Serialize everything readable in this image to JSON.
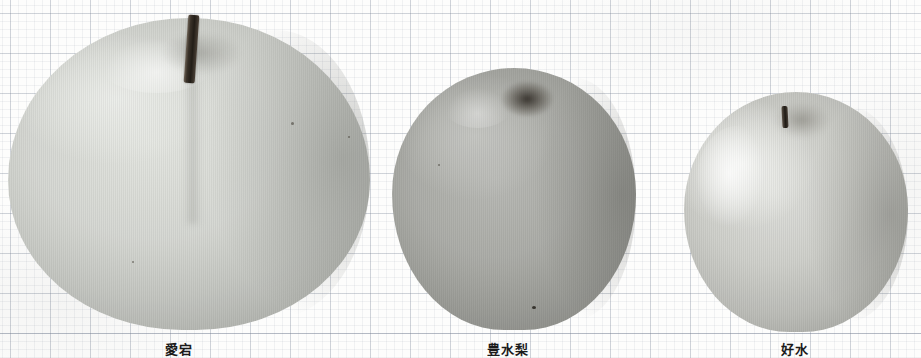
{
  "plate": {
    "title": "Pear cultivar comparison plate",
    "background": "graph-paper",
    "grid": {
      "major_spacing_px": 40,
      "minor_spacing_px": 8,
      "origin_x_px": 10,
      "origin_y_px": 13,
      "line_color": "#8792a6"
    },
    "paper_color": "#fdfdfc",
    "baseline_y_px": 333
  },
  "specimens": [
    {
      "id": "specimen-1",
      "caption": "愛宕",
      "position_label": "left",
      "relative_size": "largest",
      "tone": "pale grey",
      "body_color": "#d6d8d3",
      "shadow_color": "#acaea9",
      "stem": {
        "present": true,
        "length": "long",
        "color": "#221d17"
      },
      "calyx": "shallow depression",
      "bbox_px": {
        "x": 8,
        "y": 18,
        "w": 362,
        "h": 312
      }
    },
    {
      "id": "specimen-2",
      "caption": "豊水梨",
      "position_label": "center",
      "relative_size": "medium",
      "tone": "medium grey",
      "body_color": "#adaea9",
      "shadow_color": "#8d8e89",
      "stem": {
        "present": false,
        "length": "none",
        "color": "#262119"
      },
      "calyx": "deep sunken cavity",
      "bbox_px": {
        "x": 392,
        "y": 68,
        "w": 244,
        "h": 262
      }
    },
    {
      "id": "specimen-3",
      "caption": "好水",
      "position_label": "right",
      "relative_size": "smallest",
      "tone": "pale grey",
      "body_color": "#cfd0cb",
      "shadow_color": "#aaaba6",
      "stem": {
        "present": true,
        "length": "short",
        "color": "#1e1a14"
      },
      "calyx": "narrow cavity with short stem",
      "bbox_px": {
        "x": 684,
        "y": 92,
        "w": 224,
        "h": 240
      }
    }
  ]
}
